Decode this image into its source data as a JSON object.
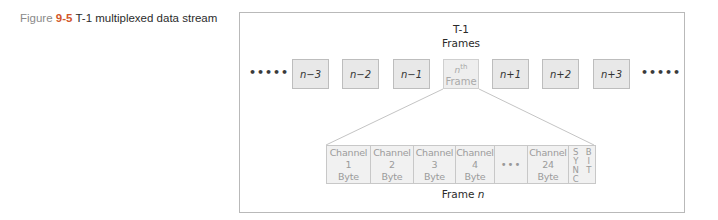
{
  "caption": {
    "figure_word": "Figure",
    "figure_number": "9-5",
    "title": "T-1 multiplexed data stream"
  },
  "diagram": {
    "group_label_line1": "T-1",
    "group_label_line2": "Frames",
    "leading_dots": "•••••",
    "trailing_dots": "•••••",
    "frames": [
      {
        "label": "n−3"
      },
      {
        "label": "n−2"
      },
      {
        "label": "n−1"
      },
      {
        "label_sup_base": "n",
        "label_sup": "th",
        "label_line2": "Frame"
      },
      {
        "label": "n+1"
      },
      {
        "label": "n+2"
      },
      {
        "label": "n+3"
      }
    ],
    "frame_detail": {
      "cells": [
        {
          "line1": "Channel",
          "line2": "1",
          "line3": "Byte"
        },
        {
          "line1": "Channel",
          "line2": "2",
          "line3": "Byte"
        },
        {
          "line1": "Channel",
          "line2": "3",
          "line3": "Byte"
        },
        {
          "line1": "Channel",
          "line2": "4",
          "line3": "Byte"
        },
        {
          "ellipsis": "•••"
        },
        {
          "line1": "Channel",
          "line2": "24",
          "line3": "Byte"
        }
      ],
      "sync_letters": [
        "S",
        "Y",
        "N",
        "C"
      ],
      "bit_letters": [
        "B",
        "I",
        "T"
      ],
      "label_prefix": "Frame",
      "label_var": "n"
    }
  },
  "colors": {
    "accent": "#d2572a",
    "box_fill": "#e8e8e8",
    "border": "#bdbdbd"
  }
}
